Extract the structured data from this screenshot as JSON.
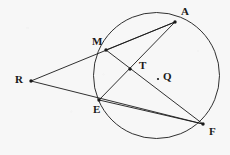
{
  "figure": {
    "background_color": "#f7f7f7",
    "stroke_color": "#1a1a1a",
    "label_color": "#1a1a1a"
  },
  "circle": {
    "name": "circle-Q",
    "center_label": "Q",
    "cx": 156.5,
    "cy": 75.5,
    "r": 63
  },
  "points": [
    {
      "id": "A",
      "label": "A",
      "x": 175,
      "y": 22,
      "label_x": 181,
      "label_y": 6,
      "on_circle": true,
      "has_dot": true
    },
    {
      "id": "M",
      "label": "M",
      "x": 106,
      "y": 50,
      "label_x": 92,
      "label_y": 36,
      "on_circle": true,
      "has_dot": true
    },
    {
      "id": "R",
      "label": "R",
      "x": 31,
      "y": 81,
      "label_x": 15,
      "label_y": 74,
      "on_circle": false,
      "has_dot": true
    },
    {
      "id": "E",
      "label": "E",
      "x": 99,
      "y": 100,
      "label_x": 93,
      "label_y": 104,
      "on_circle": true,
      "has_dot": true
    },
    {
      "id": "F",
      "label": "F",
      "x": 203,
      "y": 124,
      "label_x": 209,
      "label_y": 126,
      "on_circle": true,
      "has_dot": true
    },
    {
      "id": "T",
      "label": "T",
      "x": 130,
      "y": 69,
      "label_x": 139,
      "label_y": 60,
      "on_circle": false,
      "has_dot": true
    },
    {
      "id": "Q",
      "label": "Q",
      "x": 158,
      "y": 79,
      "label_x": 163,
      "label_y": 71,
      "on_circle": false,
      "has_dot": true
    }
  ],
  "segments": [
    {
      "name": "segment-R-M-A",
      "from": "R",
      "to": "A",
      "via": "M"
    },
    {
      "name": "segment-R-E-F",
      "from": "R",
      "to": "F",
      "via": "E"
    },
    {
      "name": "chord-M-A",
      "from": "M",
      "to": "A"
    },
    {
      "name": "chord-M-F",
      "from": "M",
      "to": "F"
    },
    {
      "name": "chord-A-E",
      "from": "A",
      "to": "E"
    },
    {
      "name": "chord-E-F",
      "from": "E",
      "to": "F"
    }
  ],
  "intersection": {
    "label": "T",
    "note": "intersection of chord M-F and chord A-E"
  }
}
